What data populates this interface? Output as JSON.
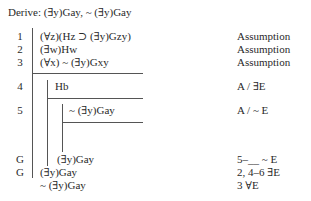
{
  "title": "Derive: (∃y)Gay, ~ (∃y)Gay",
  "lines": [
    {
      "num": "1",
      "formula": "(∀z)(Hz ⊃ (∃y)Gzy)",
      "justification": "Assumption"
    },
    {
      "num": "2",
      "formula": "(∃w)Hw",
      "justification": "Assumption"
    },
    {
      "num": "3",
      "formula": "(∀x) ~ (∃y)Gxy",
      "justification": "Assumption"
    },
    {
      "num": "4",
      "formula": "Hb",
      "justification": "A / ∃E"
    },
    {
      "num": "5",
      "formula": "~ (∃y)Gay",
      "justification": "A / ~ E"
    },
    {
      "num": "G",
      "formula": "(∃y)Gay",
      "justification": "5–__ ~ E"
    },
    {
      "num": "G",
      "formula": "(∃y)Gay",
      "justification": "2, 4–6 ∃E"
    },
    {
      "num": "",
      "formula": "~ (∃y)Gay",
      "justification": "3 ∀E"
    }
  ]
}
